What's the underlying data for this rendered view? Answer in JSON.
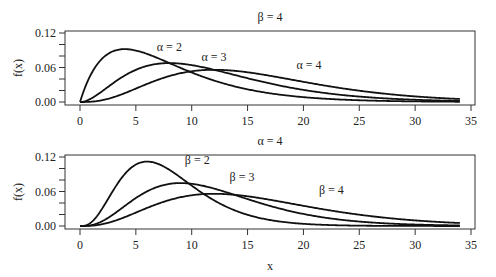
{
  "chart_data": [
    {
      "type": "line",
      "title": "β = 4",
      "xlabel": "",
      "ylabel": "f(x)",
      "xlim": [
        0,
        35
      ],
      "ylim": [
        0,
        0.12
      ],
      "x_ticks": [
        0,
        5,
        10,
        15,
        20,
        25,
        30,
        35
      ],
      "y_ticks": [
        "0.00",
        "0.06",
        "0.12"
      ],
      "y_minor_ticks": [
        0.02,
        0.04,
        0.08,
        0.1
      ],
      "distribution": "gamma (shape α, scale β)",
      "series": [
        {
          "name": "α = 2",
          "alpha": 2,
          "beta": 4,
          "label_pos": [
            8,
            0.088
          ],
          "peak": [
            4,
            0.092
          ]
        },
        {
          "name": "α = 3",
          "alpha": 3,
          "beta": 4,
          "label_pos": [
            12,
            0.071
          ],
          "peak": [
            8,
            0.068
          ]
        },
        {
          "name": "α = 4",
          "alpha": 4,
          "beta": 4,
          "label_pos": [
            20.5,
            0.058
          ],
          "peak": [
            12,
            0.056
          ]
        }
      ],
      "x_range_plotted": [
        0,
        34
      ]
    },
    {
      "type": "line",
      "title": "α = 4",
      "xlabel": "x",
      "ylabel": "f(x)",
      "xlim": [
        0,
        35
      ],
      "ylim": [
        0,
        0.12
      ],
      "x_ticks": [
        0,
        5,
        10,
        15,
        20,
        25,
        30,
        35
      ],
      "y_ticks": [
        "0.00",
        "0.06",
        "0.12"
      ],
      "y_minor_ticks": [
        0.02,
        0.04,
        0.08,
        0.1
      ],
      "distribution": "gamma (shape α, scale β)",
      "series": [
        {
          "name": "β = 2",
          "alpha": 4,
          "beta": 2,
          "label_pos": [
            10.5,
            0.108
          ],
          "peak": [
            6,
            0.112
          ]
        },
        {
          "name": "β = 3",
          "alpha": 4,
          "beta": 3,
          "label_pos": [
            14.5,
            0.078
          ],
          "peak": [
            9,
            0.075
          ]
        },
        {
          "name": "β = 4",
          "alpha": 4,
          "beta": 4,
          "label_pos": [
            22.5,
            0.056
          ],
          "peak": [
            12,
            0.056
          ]
        }
      ],
      "x_range_plotted": [
        0,
        34
      ]
    }
  ],
  "panels": [
    {
      "title": "β = 4",
      "ylabel": "f(x)",
      "labels": [
        "α = 2",
        "α = 3",
        "α = 4"
      ]
    },
    {
      "title": "α = 4",
      "ylabel": "f(x)",
      "xlabel": "x",
      "labels": [
        "β = 2",
        "β = 3",
        "β = 4"
      ]
    }
  ],
  "x_tick_labels": [
    "0",
    "5",
    "10",
    "15",
    "20",
    "25",
    "30",
    "35"
  ],
  "y_tick_labels": [
    "0.00",
    "0.06",
    "0.12"
  ]
}
